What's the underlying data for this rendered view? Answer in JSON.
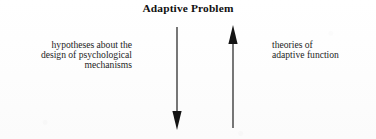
{
  "figure": {
    "title": "Adaptive Problem",
    "background_color": "#fefefe",
    "ink_color": "#1a1a1a"
  },
  "left_text": {
    "alignment": "right",
    "lines": [
      "hypotheses about the",
      "design of psychological",
      "mechanisms"
    ]
  },
  "right_text": {
    "alignment": "left",
    "lines": [
      "theories of",
      "adaptive function"
    ]
  },
  "arrows": [
    {
      "name": "downward-arrow",
      "direction": "down",
      "x": 177,
      "y_start": 27,
      "y_end": 130,
      "color": "#141414"
    },
    {
      "name": "upward-arrow",
      "direction": "up",
      "x": 233,
      "y_start": 128,
      "y_end": 25,
      "color": "#141414"
    }
  ]
}
